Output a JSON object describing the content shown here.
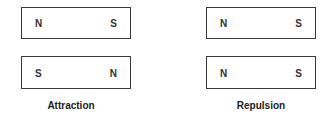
{
  "groups": [
    {
      "caption": "Attraction",
      "magnets": [
        {
          "left_pole": "N",
          "right_pole": "S"
        },
        {
          "left_pole": "S",
          "right_pole": "N"
        }
      ]
    },
    {
      "caption": "Repulsion",
      "magnets": [
        {
          "left_pole": "N",
          "right_pole": "S"
        },
        {
          "left_pole": "N",
          "right_pole": "S"
        }
      ]
    }
  ]
}
